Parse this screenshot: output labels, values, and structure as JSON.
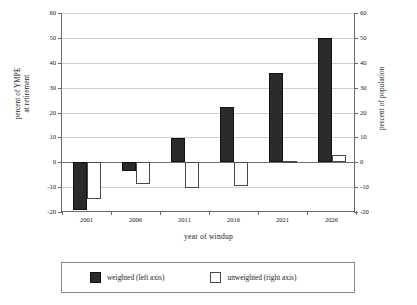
{
  "chart_data": {
    "type": "bar",
    "title": "",
    "subtitle": "",
    "xlabel": "year of windup",
    "ylabel": "percent of YMPE\nat retirement",
    "ylabel_left_line1": "percent of YMPE",
    "ylabel_left_line2": "at retirement",
    "ylabel_right": "percent of population",
    "categories": [
      "2001",
      "2006",
      "2011",
      "2016",
      "2021",
      "2026"
    ],
    "series": [
      {
        "name": "weighted (left axis)",
        "axis": "left",
        "color": "#2b2b2b",
        "fill": "solid-dark",
        "values": [
          -19,
          -3.5,
          9.7,
          22.3,
          35.8,
          50
        ]
      },
      {
        "name": "unweighted (right axis)",
        "axis": "right",
        "color": "#ffffff",
        "fill": "hollow-outline",
        "values": [
          -14.8,
          -8.8,
          -10.3,
          -9.7,
          0.7,
          3
        ]
      }
    ],
    "ylim": [
      -20,
      60
    ],
    "ylim_right": [
      -20,
      60
    ],
    "yticks": [
      60,
      50,
      40,
      30,
      20,
      10,
      0,
      -10,
      -20
    ],
    "yticks_right": [
      60,
      50,
      40,
      30,
      20,
      10,
      0,
      -10,
      -20
    ],
    "ytick_labels": [
      "60",
      "50",
      "40",
      "30",
      "20",
      "10",
      "0",
      "-10",
      "-20"
    ],
    "ytick_labels_right": [
      "60",
      "50",
      "40",
      "30",
      "20",
      "10",
      "0",
      "-10",
      "-20"
    ],
    "grid": true,
    "grid_axis": "y",
    "zero_line": true,
    "legend_position": "bottom-outside",
    "legend_entries": [
      "weighted (left axis)",
      "unweighted (right axis)"
    ]
  },
  "legend": {
    "weighted_label": "weighted (left axis)",
    "unweighted_label": "unweighted (right axis)"
  }
}
